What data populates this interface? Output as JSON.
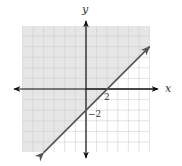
{
  "chart_data": {
    "type": "line",
    "title": "",
    "xlabel": "x",
    "ylabel": "y",
    "xlim": [
      -6,
      6
    ],
    "ylim": [
      -6,
      6
    ],
    "grid": true,
    "grid_step": 1,
    "tick_labels": [
      {
        "axis": "x",
        "value": 2,
        "text": "2"
      },
      {
        "axis": "y",
        "value": -2,
        "text": "−2"
      }
    ],
    "boundary_line": {
      "equation": "y = x - 2",
      "style": "solid",
      "points": [
        [
          -4,
          -6
        ],
        [
          6,
          4
        ]
      ],
      "arrows": "both",
      "color": "#555555"
    },
    "shaded_region": {
      "inequality": "y >= x - 2",
      "side": "above-left",
      "color": "#e6e6e6"
    },
    "x_intercept": [
      2,
      0
    ],
    "y_intercept": [
      0,
      -2
    ]
  },
  "labels": {
    "x_axis": "x",
    "y_axis": "y",
    "x_tick": "2",
    "y_tick": "−2"
  },
  "colors": {
    "shade": "#e6e6e6",
    "grid_shaded": "#c9c9c9",
    "grid_unshaded": "#dedede",
    "axis": "#111111",
    "line": "#555555"
  }
}
